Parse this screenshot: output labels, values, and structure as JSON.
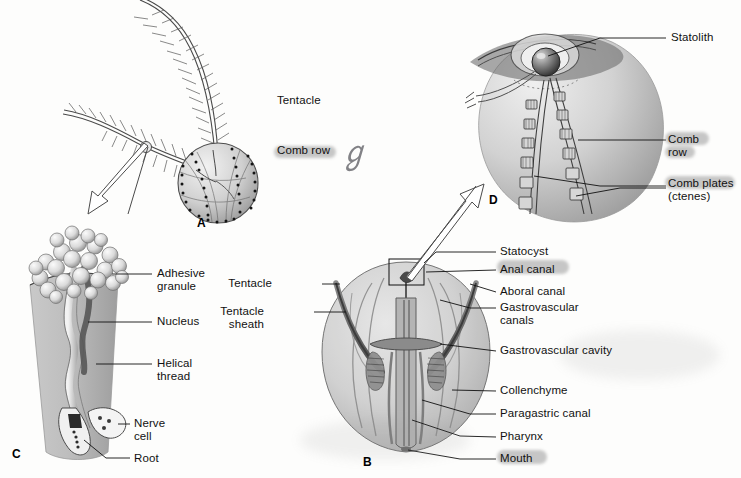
{
  "figure": {
    "background_color": "#fdfdfc",
    "ink_color": "#111111",
    "body_fill": "#c8c8c8",
    "highlight_color": "#9a9a9a"
  },
  "panels": [
    {
      "id": "A",
      "letter": "A",
      "x": 197,
      "y": 216,
      "caption": "Whole animal with tentacles and comb rows"
    },
    {
      "id": "B",
      "letter": "B",
      "x": 363,
      "y": 457,
      "caption": "Cutaway showing internal canals"
    },
    {
      "id": "C",
      "letter": "C",
      "x": 12,
      "y": 449,
      "caption": "Colloblast (adhesive cell)"
    },
    {
      "id": "D",
      "letter": "D",
      "x": 489,
      "y": 196,
      "caption": "Aboral statocyst and comb plates"
    }
  ],
  "labels": {
    "panel_a": [
      {
        "text": "Tentacle",
        "x": 277,
        "y": 101,
        "leader": [
          [
            272,
            106
          ],
          [
            240,
            106
          ]
        ],
        "highlight": false
      },
      {
        "text": "Comb row",
        "x": 277,
        "y": 150,
        "leader": [
          [
            272,
            155
          ],
          [
            243,
            155
          ]
        ],
        "highlight": true
      }
    ],
    "panel_b": [
      {
        "text": "Tentacle",
        "x": 274,
        "y": 278,
        "align": "right",
        "highlight": false
      },
      {
        "text": "Tentacle\nsheath",
        "x": 265,
        "y": 305,
        "align": "right",
        "highlight": false
      },
      {
        "text": "Statocyst",
        "x": 500,
        "y": 245,
        "highlight": false
      },
      {
        "text": "Anal canal",
        "x": 500,
        "y": 264,
        "highlight": true
      },
      {
        "text": "Aboral canal",
        "x": 500,
        "y": 286,
        "highlight": false
      },
      {
        "text": "Gastrovascular\ncanals",
        "x": 500,
        "y": 306,
        "highlight": false
      },
      {
        "text": "Gastrovascular cavity",
        "x": 500,
        "y": 345,
        "highlight": false
      },
      {
        "text": "Collenchyme",
        "x": 500,
        "y": 385,
        "highlight": false
      },
      {
        "text": "Paragastric canal",
        "x": 500,
        "y": 409,
        "highlight": false
      },
      {
        "text": "Pharynx",
        "x": 500,
        "y": 432,
        "highlight": false
      },
      {
        "text": "Mouth",
        "x": 500,
        "y": 454,
        "highlight": true
      }
    ],
    "panel_c": [
      {
        "text": "Adhesive\ngranule",
        "x": 158,
        "y": 269,
        "highlight": false
      },
      {
        "text": "Nucleus",
        "x": 158,
        "y": 320,
        "highlight": false
      },
      {
        "text": "Helical\nthread",
        "x": 158,
        "y": 358,
        "highlight": false
      },
      {
        "text": "Nerve\ncell",
        "x": 135,
        "y": 421,
        "highlight": false
      },
      {
        "text": "Root",
        "x": 135,
        "y": 455,
        "highlight": false
      }
    ],
    "panel_d": [
      {
        "text": "Statolith",
        "x": 672,
        "y": 37,
        "highlight": false
      },
      {
        "text": "Comb\nrow",
        "x": 668,
        "y": 137,
        "highlight": true
      },
      {
        "text": "Comb plates\n(ctenes)",
        "x": 668,
        "y": 180,
        "highlight": true
      }
    ]
  },
  "annotations": [
    {
      "name": "handwritten-mark",
      "text": "ℊ",
      "x": 340,
      "y": 138
    }
  ],
  "arrows": [
    {
      "name": "arrow-tentacle-to-colloblast",
      "from": [
        146,
        147
      ],
      "to": [
        95,
        215
      ]
    },
    {
      "name": "arrow-statocyst-to-panel-d",
      "from": [
        406,
        277
      ],
      "to": [
        470,
        186
      ]
    }
  ]
}
